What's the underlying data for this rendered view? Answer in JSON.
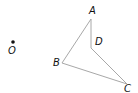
{
  "diagram": {
    "type": "geometry",
    "line_color": "#a8a8a8",
    "point_color": "#111111",
    "points": {
      "O": {
        "label": "O",
        "x": 13,
        "y": 42,
        "label_x": 8,
        "label_y": 54,
        "dot": true
      },
      "A": {
        "label": "A",
        "x": 91,
        "y": 19,
        "label_x": 89,
        "label_y": 14
      },
      "D": {
        "label": "D",
        "x": 91,
        "y": 48,
        "label_x": 95,
        "label_y": 45
      },
      "B": {
        "label": "B",
        "x": 62,
        "y": 63,
        "label_x": 53,
        "label_y": 66
      },
      "C": {
        "label": "C",
        "x": 127,
        "y": 84,
        "label_x": 124,
        "label_y": 92
      }
    },
    "polygon": [
      "A",
      "D",
      "C",
      "B"
    ]
  }
}
